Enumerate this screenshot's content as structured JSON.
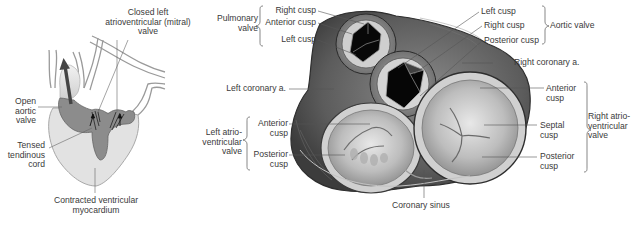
{
  "left_diagram": {
    "title": "Ventricular systole schematic",
    "labels": {
      "mitral": [
        "Closed left",
        "atrioventricular (mitral)",
        "valve"
      ],
      "aortic": [
        "Open",
        "aortic",
        "valve"
      ],
      "cord": [
        "Tensed",
        "tendinous",
        "cord"
      ],
      "myocardium": [
        "Contracted ventricular",
        "myocardium"
      ]
    },
    "colors": {
      "myocardium_fill": "#e2e2e2",
      "cavity_fill": "#8c8c8c",
      "arrow": "#444444",
      "vessel_stroke": "#9a9a9a"
    }
  },
  "right_diagram": {
    "title": "Heart valves, superior view",
    "pulmonary_valve": {
      "group_label": [
        "Pulmonary",
        "valve"
      ],
      "cusps": [
        "Right cusp",
        "Anterior cusp",
        "Left cusp"
      ]
    },
    "aortic_valve": {
      "group_label": "Aortic valve",
      "cusps": [
        "Left cusp",
        "Right cusp",
        "Posterior cusp"
      ]
    },
    "right_coronary": "Right coronary a.",
    "left_coronary": "Left coronary a.",
    "left_av_valve": {
      "group_label": [
        "Left atrio-",
        "ventricular",
        "valve"
      ],
      "cusps": [
        [
          "Anterior",
          "cusp"
        ],
        [
          "Posterior",
          "cusp"
        ]
      ]
    },
    "right_av_valve": {
      "group_label": [
        "Right atrio-",
        "ventricular",
        "valve"
      ],
      "cusps": [
        [
          "Anterior",
          "cusp"
        ],
        [
          "Septal",
          "cusp"
        ],
        [
          "Posterior",
          "cusp"
        ]
      ]
    },
    "coronary_sinus": "Coronary sinus",
    "colors": {
      "tissue_dark": "#5a5a5a",
      "tissue_mid": "#9a9a9a",
      "tissue_light": "#d6d6d6",
      "lumen": "#0a0a0a",
      "leader_line": "#555555"
    }
  }
}
